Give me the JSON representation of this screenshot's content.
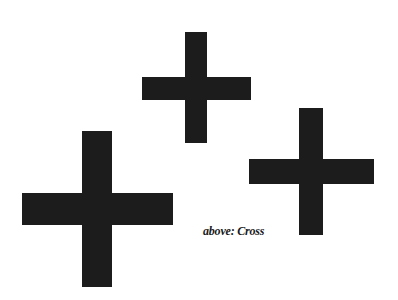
{
  "caption": "above: Cross",
  "color": "#1c1c1c",
  "shapes": [
    {
      "name": "cross-top",
      "v": [
        185,
        32,
        22,
        111
      ],
      "h": [
        142,
        77,
        109,
        23
      ]
    },
    {
      "name": "cross-right",
      "v": [
        299,
        108,
        24,
        127
      ],
      "h": [
        249,
        159,
        125,
        25
      ]
    },
    {
      "name": "cross-bottom-left",
      "v": [
        82,
        131,
        30,
        156
      ],
      "h": [
        22,
        193,
        151,
        32
      ]
    }
  ]
}
